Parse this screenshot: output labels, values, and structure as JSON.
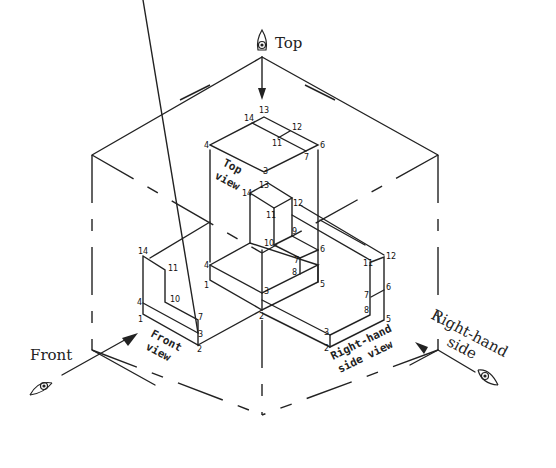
{
  "viewing_directions": {
    "top": "Top",
    "front": "Front",
    "right": "Right-hand side",
    "right_line1": "Right-hand",
    "right_line2": "side"
  },
  "view_labels": {
    "top_line1": "Top",
    "top_line2": "view",
    "front_line1": "Front",
    "front_line2": "view",
    "side_line1": "Right-hand",
    "side_line2": "side view"
  },
  "icons": [
    "eye-icon-top",
    "eye-icon-front",
    "eye-icon-right",
    "arrow-top",
    "arrow-front",
    "arrow-right"
  ],
  "vertex_labels": {
    "object": [
      "1",
      "2",
      "3",
      "4",
      "5",
      "6",
      "7",
      "8",
      "9",
      "10",
      "11",
      "12",
      "13",
      "14"
    ],
    "top_view": [
      "13",
      "14",
      "12",
      "11",
      "4",
      "6",
      "7",
      "3"
    ],
    "front_view": [
      "14",
      "11",
      "10",
      "4",
      "1",
      "7",
      "3",
      "2"
    ],
    "side_view": [
      "11",
      "12",
      "7",
      "6",
      "8",
      "5",
      "3",
      "2"
    ]
  }
}
